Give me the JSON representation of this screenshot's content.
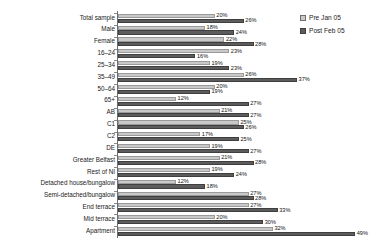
{
  "chart_data": {
    "type": "bar",
    "orientation": "horizontal",
    "title": "",
    "xlabel": "",
    "ylabel": "",
    "xlim": [
      0,
      50
    ],
    "grid": false,
    "legend_position": "top-right",
    "value_suffix": "%",
    "categories": [
      "Total sample",
      "Male",
      "Female",
      "16–24",
      "25–34",
      "35–49",
      "50–64",
      "65+",
      "AB",
      "C1",
      "C2",
      "DE",
      "Greater Belfast",
      "Rest of NI",
      "Detached house/bungalow",
      "Semi-detached/bungalow",
      "End terrace",
      "Mid terrace",
      "Apartment"
    ],
    "series": [
      {
        "name": "Pre Jan 05",
        "color": "#c9c9c9",
        "values": [
          20,
          18,
          22,
          23,
          19,
          26,
          20,
          12,
          21,
          25,
          17,
          19,
          21,
          19,
          12,
          27,
          27,
          20,
          32
        ],
        "labels": [
          "20%",
          "18%",
          "22%",
          "23%",
          "19%",
          "26%",
          "20%",
          "12%",
          "21%",
          "25%",
          "17%",
          "19%",
          "21%",
          "19%",
          "12%",
          "27%",
          "27%",
          "20%",
          "32%"
        ]
      },
      {
        "name": "Post Feb 05",
        "color": "#5c5c5c",
        "values": [
          26,
          24,
          28,
          16,
          23,
          37,
          19,
          27,
          27,
          26,
          25,
          27,
          28,
          24,
          18,
          28,
          33,
          30,
          49
        ],
        "labels": [
          "26%",
          "24%",
          "28%",
          "16%",
          "23%",
          "37%",
          "19%",
          "27%",
          "27%",
          "26%",
          "25%",
          "27%",
          "28%",
          "24%",
          "18%",
          "28%",
          "33%",
          "30%",
          "49%"
        ]
      }
    ]
  },
  "legend": {
    "items": [
      {
        "label": "Pre Jan 05",
        "swatch": "pre"
      },
      {
        "label": "Post Feb 05",
        "swatch": "post"
      }
    ]
  }
}
